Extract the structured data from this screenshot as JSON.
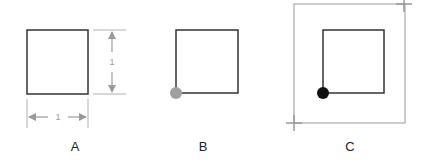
{
  "figure": {
    "panels": [
      {
        "id": "A",
        "label": "A",
        "description": "Unit square with dimension annotations",
        "square": {
          "x": 27,
          "y": 30,
          "w": 61,
          "h": 64,
          "stroke": "#333333"
        },
        "dimensions": {
          "width_label": "1",
          "height_label": "1",
          "color": "#9a9a9a"
        }
      },
      {
        "id": "B",
        "label": "B",
        "description": "Square with origin point marked at bottom-left corner",
        "square": {
          "x": 176,
          "y": 30,
          "w": 62,
          "h": 63,
          "stroke": "#333333"
        },
        "origin_point": {
          "cx": 176,
          "cy": 93,
          "r": 6,
          "color": "#a0a0a0"
        }
      },
      {
        "id": "C",
        "label": "C",
        "description": "Square with origin point inside a bounding frame with corner crosshairs",
        "frame": {
          "x": 294,
          "y": 4,
          "w": 111,
          "h": 119,
          "stroke": "#aaaaaa"
        },
        "crosshairs": [
          {
            "position": "top-right",
            "cx": 404,
            "cy": 4
          },
          {
            "position": "bottom-left",
            "cx": 294,
            "cy": 123
          }
        ],
        "square": {
          "x": 323,
          "y": 30,
          "w": 61,
          "h": 63,
          "stroke": "#333333"
        },
        "origin_point": {
          "cx": 323,
          "cy": 93,
          "r": 6,
          "color": "#111111"
        }
      }
    ],
    "colors": {
      "shape_stroke": "#333333",
      "annotation": "#9a9a9a",
      "frame": "#aaaaaa",
      "point_gray": "#a0a0a0",
      "point_black": "#111111",
      "background": "#ffffff"
    }
  }
}
